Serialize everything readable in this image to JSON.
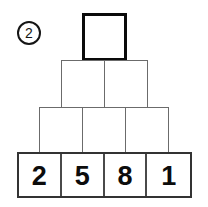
{
  "puzzle": {
    "marker": {
      "label": "2",
      "style": "circled-number"
    },
    "type": "number-pyramid",
    "rows": [
      {
        "level": 1,
        "position": "top",
        "emphasized": true,
        "cells": [
          {
            "value": "",
            "filled": false
          }
        ]
      },
      {
        "level": 2,
        "position": "middle-upper",
        "emphasized": false,
        "cells": [
          {
            "value": "",
            "filled": false
          },
          {
            "value": "",
            "filled": false
          }
        ]
      },
      {
        "level": 3,
        "position": "middle-lower",
        "emphasized": false,
        "cells": [
          {
            "value": "",
            "filled": false
          },
          {
            "value": "",
            "filled": false
          },
          {
            "value": "",
            "filled": false
          }
        ]
      },
      {
        "level": 4,
        "position": "bottom",
        "emphasized": false,
        "cells": [
          {
            "value": "2",
            "filled": true
          },
          {
            "value": "5",
            "filled": true
          },
          {
            "value": "8",
            "filled": true
          },
          {
            "value": "1",
            "filled": true
          }
        ]
      }
    ]
  },
  "colors": {
    "background": "#ffffff",
    "thin_border": "#6b6b6b",
    "target_border": "#0a0a0a",
    "bottom_frame": "#333333",
    "digit": "#0c0c0c",
    "marker": "#151515"
  }
}
